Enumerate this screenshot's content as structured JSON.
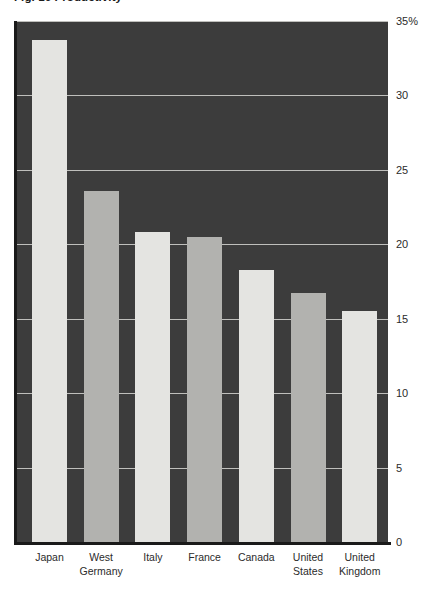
{
  "chart_data": {
    "type": "bar",
    "title": "Fig. 16  Productivity",
    "categories": [
      "Japan",
      "West Germany",
      "Italy",
      "France",
      "Canada",
      "United States",
      "United Kingdom"
    ],
    "values": [
      33.7,
      23.6,
      20.8,
      20.5,
      18.3,
      16.7,
      15.5
    ],
    "series": [
      {
        "name": "Share",
        "values": [
          33.7,
          23.6,
          20.8,
          20.5,
          18.3,
          16.7,
          15.5
        ]
      }
    ],
    "xlabel": "",
    "ylabel": "",
    "ylim": [
      0,
      35
    ],
    "ytick_values": [
      0,
      5,
      10,
      15,
      20,
      25,
      30,
      35
    ],
    "ytick_labels": [
      "0",
      "5",
      "10",
      "15",
      "20",
      "25",
      "30",
      "35%"
    ],
    "unit": "%",
    "grid": true,
    "grid_axis": "y",
    "legend": false,
    "legend_position": "none",
    "annotations": []
  },
  "style": {
    "plot_background": "#3c3c3c",
    "page_background": "#ffffff",
    "gridline_color": "#d6d6d2",
    "axis_color": "#1a1a1a",
    "bar_color_light": "#e4e4e1",
    "bar_color_gray": "#b2b2af",
    "tick_text_color": "#2b2b2b",
    "bar_fill_pattern": [
      "light",
      "gray",
      "light",
      "gray",
      "light",
      "gray",
      "light"
    ]
  },
  "geometry": {
    "plot_left": 17,
    "plot_top": 21,
    "plot_width": 371,
    "plot_height": 521,
    "bar_width": 35,
    "bar_pitch": 51.7,
    "first_bar_left": 32
  }
}
